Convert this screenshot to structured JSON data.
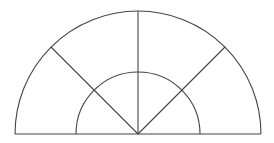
{
  "diagram": {
    "type": "semicircle-sector-diagram",
    "center": [
      138,
      134
    ],
    "outer_radius": 123,
    "inner_radius": 62,
    "ray_angles_deg": [
      45,
      90,
      135
    ],
    "stroke_color": "#444444",
    "background": "#ffffff"
  }
}
